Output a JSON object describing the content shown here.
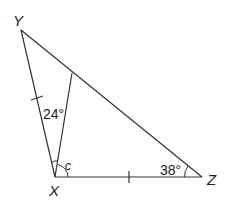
{
  "diagram": {
    "type": "triangle",
    "vertices": {
      "Y": {
        "label": "Y",
        "x": 21,
        "y": 30
      },
      "X": {
        "label": "X",
        "x": 55,
        "y": 177
      },
      "Z": {
        "label": "Z",
        "x": 202,
        "y": 177
      }
    },
    "cevian": {
      "from": "X",
      "to_point_on": "YZ",
      "end": {
        "x": 72,
        "y": 73
      }
    },
    "angles": {
      "inner_at_X": {
        "label": "24°"
      },
      "variable_at_X": {
        "label": "c"
      },
      "at_Z": {
        "label": "38°"
      }
    },
    "equal_sides": [
      "XY",
      "XZ"
    ],
    "colors": {
      "stroke": "#333333",
      "text": "#222222",
      "background": "#ffffff"
    }
  }
}
